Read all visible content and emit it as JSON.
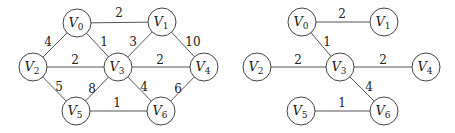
{
  "graphs": [
    {
      "name": "original-graph",
      "node_radius": 14,
      "nodes": [
        {
          "id": "V0",
          "letter": "V",
          "sub": "0",
          "x": 77,
          "y": 23
        },
        {
          "id": "V1",
          "letter": "V",
          "sub": "1",
          "x": 162,
          "y": 22
        },
        {
          "id": "V2",
          "letter": "V",
          "sub": "2",
          "x": 33,
          "y": 67
        },
        {
          "id": "V3",
          "letter": "V",
          "sub": "3",
          "x": 118,
          "y": 67
        },
        {
          "id": "V4",
          "letter": "V",
          "sub": "4",
          "x": 204,
          "y": 67
        },
        {
          "id": "V5",
          "letter": "V",
          "sub": "5",
          "x": 76,
          "y": 111
        },
        {
          "id": "V6",
          "letter": "V",
          "sub": "6",
          "x": 161,
          "y": 111
        }
      ],
      "edges": [
        {
          "from": "V0",
          "to": "V1",
          "weight": "2",
          "lx": 119,
          "ly": 17
        },
        {
          "from": "V0",
          "to": "V2",
          "weight": "4",
          "lx": 48,
          "ly": 46
        },
        {
          "from": "V0",
          "to": "V3",
          "weight": "1",
          "lx": 104,
          "ly": 46
        },
        {
          "from": "V1",
          "to": "V3",
          "weight": "3",
          "lx": 133,
          "ly": 46
        },
        {
          "from": "V1",
          "to": "V4",
          "weight": "10",
          "lx": 193,
          "ly": 46
        },
        {
          "from": "V2",
          "to": "V3",
          "weight": "2",
          "lx": 75,
          "ly": 64
        },
        {
          "from": "V3",
          "to": "V4",
          "weight": "2",
          "lx": 160,
          "ly": 64
        },
        {
          "from": "V2",
          "to": "V5",
          "weight": "5",
          "lx": 59,
          "ly": 91
        },
        {
          "from": "V3",
          "to": "V5",
          "weight": "8",
          "lx": 92,
          "ly": 93
        },
        {
          "from": "V3",
          "to": "V6",
          "weight": "4",
          "lx": 144,
          "ly": 91
        },
        {
          "from": "V4",
          "to": "V6",
          "weight": "6",
          "lx": 178,
          "ly": 93
        },
        {
          "from": "V5",
          "to": "V6",
          "weight": "1",
          "lx": 117,
          "ly": 107
        }
      ]
    },
    {
      "name": "minimum-spanning-tree",
      "node_radius": 14,
      "nodes": [
        {
          "id": "V0",
          "letter": "V",
          "sub": "0",
          "x": 302,
          "y": 22
        },
        {
          "id": "V1",
          "letter": "V",
          "sub": "1",
          "x": 384,
          "y": 22
        },
        {
          "id": "V2",
          "letter": "V",
          "sub": "2",
          "x": 257,
          "y": 67
        },
        {
          "id": "V3",
          "letter": "V",
          "sub": "3",
          "x": 340,
          "y": 67
        },
        {
          "id": "V4",
          "letter": "V",
          "sub": "4",
          "x": 426,
          "y": 67
        },
        {
          "id": "V5",
          "letter": "V",
          "sub": "5",
          "x": 301,
          "y": 111
        },
        {
          "id": "V6",
          "letter": "V",
          "sub": "6",
          "x": 384,
          "y": 111
        }
      ],
      "edges": [
        {
          "from": "V0",
          "to": "V1",
          "weight": "2",
          "lx": 342,
          "ly": 18
        },
        {
          "from": "V0",
          "to": "V3",
          "weight": "1",
          "lx": 327,
          "ly": 46
        },
        {
          "from": "V2",
          "to": "V3",
          "weight": "2",
          "lx": 298,
          "ly": 64
        },
        {
          "from": "V3",
          "to": "V4",
          "weight": "2",
          "lx": 383,
          "ly": 64
        },
        {
          "from": "V3",
          "to": "V6",
          "weight": "4",
          "lx": 369,
          "ly": 91
        },
        {
          "from": "V5",
          "to": "V6",
          "weight": "1",
          "lx": 342,
          "ly": 107
        }
      ]
    }
  ]
}
